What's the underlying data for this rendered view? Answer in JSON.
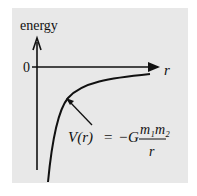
{
  "diagram": {
    "y_axis_label": "energy",
    "x_axis_label": "r",
    "origin_label": "0",
    "formula": {
      "lhs": "V(r)",
      "equals": "=",
      "prefix": "−G",
      "numerator": "m₁m₂",
      "denominator": "r"
    },
    "colors": {
      "background": "#e8e8e8",
      "ink": "#111111"
    }
  }
}
